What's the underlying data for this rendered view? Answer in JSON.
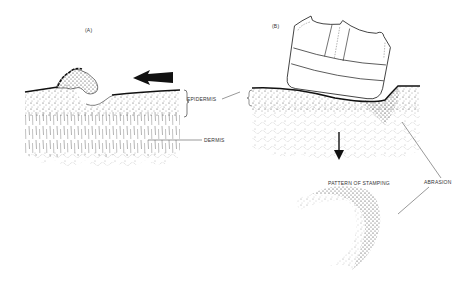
{
  "panels": {
    "a": {
      "label": "(A)",
      "epidermis_label": "EPIDERMIS",
      "dermis_label": "DERMIS"
    },
    "b": {
      "label": "(B)",
      "pattern_label": "PATTERN OF STAMPING",
      "abrasion_label": "ABRASION"
    }
  },
  "colors": {
    "ink": "#1a1a1a",
    "background": "#ffffff"
  }
}
